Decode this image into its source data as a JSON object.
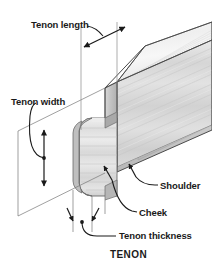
{
  "figure": {
    "caption": "TENON"
  },
  "labels": {
    "tenon_length": "Tenon length",
    "tenon_width": "Tenon width",
    "shoulder": "Shoulder",
    "cheek": "Cheek",
    "tenon_thickness": "Tenon thickness"
  },
  "colors": {
    "background": "#ffffff",
    "text": "#1a1a1a",
    "line": "#1a1a1a",
    "wood_top_face": "#f2f2f2",
    "wood_front_face": "#dcdcdc",
    "wood_end_grain": "#c9c9c9",
    "wood_shadow": "#b4b4b4",
    "tenon_face": "#e3e3e3",
    "tenon_edge": "#bdbdbd",
    "outline": "#555555"
  }
}
